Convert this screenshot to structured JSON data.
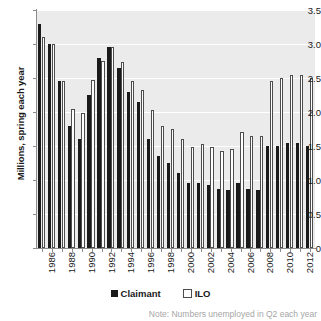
{
  "chart_data": {
    "type": "bar",
    "title": "",
    "xlabel": "",
    "ylabel": "Millions, spring each year",
    "ylim": [
      0,
      3.5
    ],
    "yticks": [
      "0",
      "0.5",
      "1.0",
      "1.5",
      "2.0",
      "2.5",
      "3.0",
      "3.5"
    ],
    "ytick_values": [
      0,
      0.5,
      1.0,
      1.5,
      2.0,
      2.5,
      3.0,
      3.5
    ],
    "grid": true,
    "legend_position": "bottom-center",
    "categories": [
      "1986",
      "1987",
      "1988",
      "1989",
      "1990",
      "1991",
      "1992",
      "1993",
      "1994",
      "1995",
      "1996",
      "1997",
      "1998",
      "1999",
      "2000",
      "2001",
      "2002",
      "2003",
      "2004",
      "2005",
      "2006",
      "2007",
      "2008",
      "2009",
      "2010",
      "2011",
      "2012",
      "2013"
    ],
    "xtick_labels": [
      "1986",
      "",
      "1988",
      "",
      "1990",
      "",
      "1992",
      "",
      "1994",
      "",
      "1996",
      "",
      "1998",
      "",
      "2000",
      "",
      "2002",
      "",
      "2004",
      "",
      "2006",
      "",
      "2008",
      "",
      "2010",
      "",
      "2012",
      ""
    ],
    "series": [
      {
        "name": "Claimant",
        "color": "#1a1a1a",
        "values": [
          3.3,
          3.0,
          2.45,
          1.8,
          1.6,
          2.25,
          2.8,
          2.95,
          2.65,
          2.3,
          2.15,
          1.6,
          1.35,
          1.25,
          1.1,
          0.95,
          0.95,
          0.93,
          0.87,
          0.85,
          0.95,
          0.87,
          0.85,
          1.5,
          1.5,
          1.55,
          1.55,
          1.5
        ]
      },
      {
        "name": "ILO",
        "color": "#ffffff",
        "values": [
          3.1,
          3.0,
          2.45,
          2.05,
          1.98,
          2.47,
          2.75,
          2.95,
          2.73,
          2.45,
          2.33,
          2.03,
          1.8,
          1.75,
          1.6,
          1.48,
          1.53,
          1.48,
          1.43,
          1.45,
          1.7,
          1.65,
          1.65,
          2.45,
          2.5,
          2.55,
          2.55,
          2.5
        ]
      }
    ],
    "note": "Note: Numbers unemployed in Q2 each year"
  },
  "legend": {
    "claimant_label": "Claimant",
    "ilo_label": "ILO"
  },
  "axes": {
    "y_title": "Millions, spring each year"
  }
}
